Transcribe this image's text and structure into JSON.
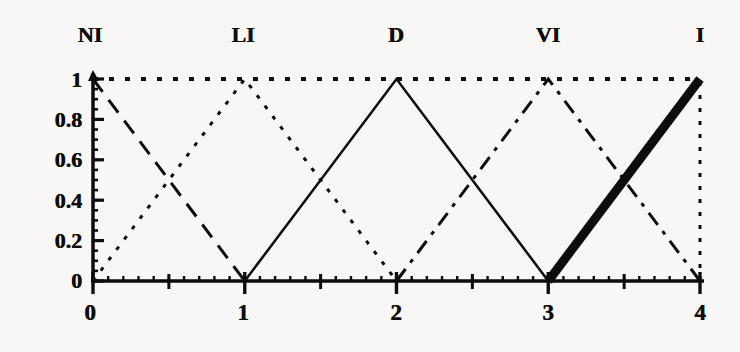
{
  "chart_data": {
    "type": "line",
    "title": "",
    "xlabel": "",
    "ylabel": "",
    "xlim": [
      0,
      4
    ],
    "ylim": [
      0,
      1
    ],
    "grid": false,
    "legend_position": "top",
    "x_ticks": [
      "0",
      "1",
      "2",
      "3",
      "4"
    ],
    "x_tick_values": [
      0,
      1,
      2,
      3,
      4
    ],
    "x_minor_tick_values": [
      0.5,
      1.5,
      2.5,
      3.5
    ],
    "y_ticks": [
      "0",
      "0.2",
      "0.4",
      "0.6",
      "0.8",
      "1"
    ],
    "y_tick_values": [
      0,
      0.2,
      0.4,
      0.6,
      0.8,
      1
    ],
    "annotations": [
      {
        "text": "NI",
        "x": 0.0
      },
      {
        "text": "LI",
        "x": 1.0
      },
      {
        "text": "D",
        "x": 2.0
      },
      {
        "text": "VI",
        "x": 3.0
      },
      {
        "text": "I",
        "x": 4.0
      }
    ],
    "series": [
      {
        "name": "NI",
        "style": "long-dash",
        "color": "#0d0d0d",
        "width": 3,
        "x": [
          0,
          1
        ],
        "values": [
          1,
          0
        ]
      },
      {
        "name": "LI",
        "style": "dotted",
        "color": "#0d0d0d",
        "width": 3,
        "x": [
          0,
          1,
          2
        ],
        "values": [
          0,
          1,
          0
        ]
      },
      {
        "name": "D",
        "style": "solid",
        "color": "#0d0d0d",
        "width": 2.5,
        "x": [
          1,
          2,
          3
        ],
        "values": [
          0,
          1,
          0
        ]
      },
      {
        "name": "VI",
        "style": "dash-dot",
        "color": "#0d0d0d",
        "width": 3,
        "x": [
          2,
          3,
          4
        ],
        "values": [
          0,
          1,
          0
        ]
      },
      {
        "name": "I",
        "style": "thick-solid",
        "color": "#0d0d0d",
        "width": 9,
        "x": [
          3,
          4
        ],
        "values": [
          0,
          1
        ]
      },
      {
        "name": "upper-bound",
        "style": "square-dotted",
        "color": "#0d0d0d",
        "width": 4,
        "x": [
          0,
          4
        ],
        "values": [
          1,
          1
        ]
      },
      {
        "name": "right-bound",
        "style": "square-dotted-vertical",
        "color": "#0d0d0d",
        "width": 3,
        "x": [
          4,
          4
        ],
        "values": [
          0,
          1
        ]
      }
    ]
  },
  "axes": {
    "y_label_0": "0",
    "y_label_02": "0.2",
    "y_label_04": "0.4",
    "y_label_06": "0.6",
    "y_label_08": "0.8",
    "y_label_1": "1",
    "x_label_0": "0",
    "x_label_1": "1",
    "x_label_2": "2",
    "x_label_3": "3",
    "x_label_4": "4"
  },
  "terms": {
    "ni": "NI",
    "li": "LI",
    "d": "D",
    "vi": "VI",
    "i": "I"
  },
  "colors": {
    "ink": "#0d0d0d",
    "background": "#f8f7f5"
  }
}
